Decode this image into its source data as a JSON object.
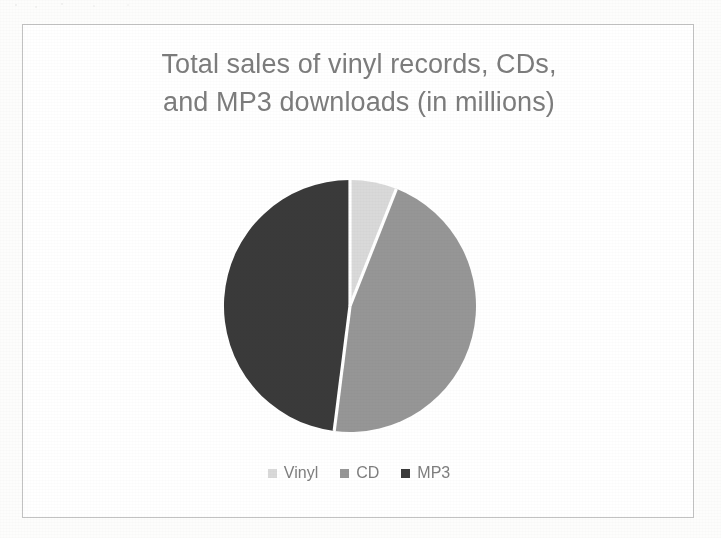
{
  "document": {
    "page_background": "#fdfdfc",
    "frame_border_color": "#c2c2c2"
  },
  "chart_data": {
    "type": "pie",
    "title": "Total sales of vinyl records, CDs,\nand MP3 downloads (in millions)",
    "title_line1": "Total sales of vinyl records, CDs,",
    "title_line2": "and MP3 downloads (in millions)",
    "xlabel": "",
    "ylabel": "",
    "unit": "millions",
    "legend_position": "bottom",
    "grid": false,
    "start_angle_deg": 0,
    "direction": "clockwise",
    "categories": [
      "Vinyl",
      "CD",
      "MP3"
    ],
    "values": [
      6,
      46,
      48
    ],
    "percentages": [
      6,
      46,
      48
    ],
    "angles_deg": [
      21.6,
      165.6,
      172.8
    ],
    "colors": [
      "#d9d9d9",
      "#969696",
      "#3a3a3a"
    ],
    "slices": [
      {
        "label": "Vinyl",
        "value": 6,
        "percent": 6,
        "angle_deg": 21.6,
        "color": "#d9d9d9"
      },
      {
        "label": "CD",
        "value": 46,
        "percent": 46,
        "angle_deg": 165.6,
        "color": "#969696"
      },
      {
        "label": "MP3",
        "value": 48,
        "percent": 48,
        "angle_deg": 172.8,
        "color": "#3a3a3a"
      }
    ],
    "slice_separator_color": "#ffffff"
  },
  "legend": {
    "items": [
      {
        "label": "Vinyl",
        "color": "#d9d9d9"
      },
      {
        "label": "CD",
        "color": "#969696"
      },
      {
        "label": "MP3",
        "color": "#3a3a3a"
      }
    ]
  }
}
